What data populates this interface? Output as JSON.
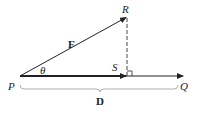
{
  "diagram": {
    "points": {
      "P": {
        "label": "P",
        "x": 20,
        "y": 76
      },
      "R": {
        "label": "R",
        "x": 127,
        "y": 17
      },
      "S": {
        "label": "S",
        "x": 127,
        "y": 76
      },
      "Q": {
        "label": "Q",
        "x": 183,
        "y": 76
      }
    },
    "labels": {
      "force": "F",
      "displacement": "D",
      "angle": "θ",
      "P": "P",
      "R": "R",
      "S": "S",
      "Q": "Q"
    },
    "colors": {
      "stroke": "#222222",
      "brace": "#999999"
    }
  }
}
